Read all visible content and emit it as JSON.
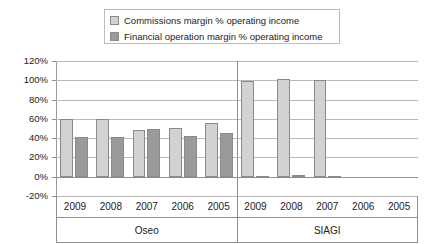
{
  "chart_data": {
    "type": "bar",
    "title": "",
    "xlabel": "",
    "ylabel": "",
    "ylim": [
      -20,
      120
    ],
    "grid": true,
    "legend_position": "top-center",
    "categories": [
      "2009",
      "2008",
      "2007",
      "2006",
      "2005",
      "2009",
      "2008",
      "2007",
      "2006",
      "2005"
    ],
    "groups": [
      {
        "label": "Oseo",
        "categories": [
          "2009",
          "2008",
          "2007",
          "2006",
          "2005"
        ]
      },
      {
        "label": "SIAGI",
        "categories": [
          "2009",
          "2008",
          "2007",
          "2006",
          "2005"
        ]
      }
    ],
    "series": [
      {
        "name": "Commissions margin  %  operating income",
        "color": "#d2d2d2",
        "values": [
          60,
          60,
          48,
          51,
          56,
          99,
          101,
          100,
          null,
          null
        ]
      },
      {
        "name": "Financial operation margin  %  operating income",
        "color": "#9a9a9a",
        "values": [
          41,
          41,
          50,
          42,
          45,
          1,
          2,
          1,
          null,
          null
        ]
      }
    ],
    "ticks": [
      {
        "label": "120%",
        "value": 120
      },
      {
        "label": "100%",
        "value": 100
      },
      {
        "label": "80%",
        "value": 80
      },
      {
        "label": "60%",
        "value": 60
      },
      {
        "label": "40%",
        "value": 40
      },
      {
        "label": "20%",
        "value": 20
      },
      {
        "label": "0%",
        "value": 0
      },
      {
        "label": "-20%",
        "value": -20
      }
    ]
  },
  "legend": {
    "items": [
      {
        "label": "Commissions margin  % operating income",
        "color": "#d2d2d2"
      },
      {
        "label": "Financial operation margin  %  operating income",
        "color": "#9a9a9a"
      }
    ]
  }
}
